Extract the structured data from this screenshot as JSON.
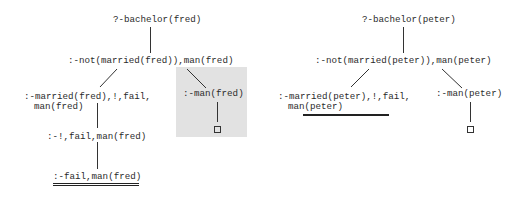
{
  "diagram": {
    "type": "SLD resolution trees",
    "trees": [
      {
        "name": "fred",
        "root": "?-bachelor(fred)",
        "level1": ":-not(married(fred)),man(fred)",
        "left_branch": {
          "node1_line1": ":-married(fred),!,fail,",
          "node1_line2": "man(fred)",
          "node2": ":-!,fail,man(fred)",
          "node3": ":-fail,man(fred)",
          "node3_underlined": true
        },
        "right_branch": {
          "node1": ":-man(fred)",
          "leaf": "empty-clause",
          "highlighted": true
        }
      },
      {
        "name": "peter",
        "root": "?-bachelor(peter)",
        "level1": ":-not(married(peter)),man(peter)",
        "left_branch": {
          "node1_line1": ":-married(peter),!,fail,",
          "node1_line2": "man(peter)",
          "node1_underlined": true
        },
        "right_branch": {
          "node1": ":-man(peter)",
          "leaf": "empty-clause",
          "highlighted": false
        }
      }
    ],
    "colors": {
      "text": "#2a2a2a",
      "line": "#333333",
      "highlight_box": "#e2e2e2"
    }
  }
}
